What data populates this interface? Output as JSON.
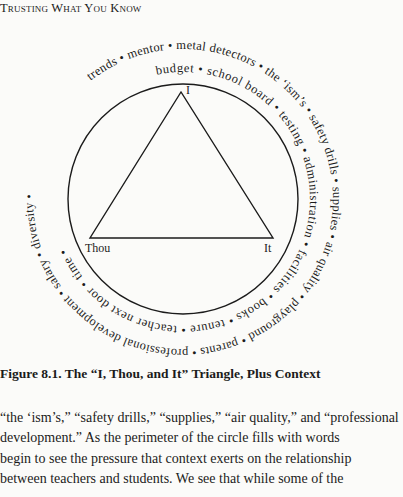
{
  "running_head": "Trusting What You Know",
  "figure": {
    "vertices": {
      "top": "I",
      "left": "Thou",
      "right": "It"
    },
    "outer_ring": [
      "trends",
      "mentor",
      "metal detectors",
      "the 'ism's",
      "safety drills",
      "supplies",
      "air quality",
      "playground",
      "parents",
      "professional development",
      "salary",
      "diversity"
    ],
    "inner_ring": [
      "budget",
      "school board",
      "testing",
      "administration",
      "facilities",
      "books",
      "tenure",
      "teacher next door",
      "time"
    ],
    "outer_text": "trends • mentor • metal detectors • the ‘ism’s • safety drills • supplies • air quality • playground • parents • professional development • salary • diversity •",
    "inner_text": "budget • school board • testing • administration • facilities • books • tenure • teacher next door • time •",
    "colors": {
      "ink": "#1b1b1b",
      "paper": "#fbfbf9"
    }
  },
  "caption": "Figure 8.1.  The “I, Thou, and It” Triangle, Plus Context",
  "body_lines": [
    "“the ‘ism’s,” “safety drills,” “supplies,” “air quality,” and “professional",
    "development.” As the perimeter of the circle fills with words",
    "begin to see the pressure that context exerts on the relationship",
    "between teachers and students. We see that while some of the"
  ]
}
